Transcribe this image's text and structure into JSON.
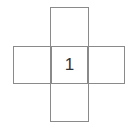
{
  "diagram": {
    "type": "cube-net-cross",
    "squares": [
      {
        "position": "top",
        "label": ""
      },
      {
        "position": "left",
        "label": ""
      },
      {
        "position": "center",
        "label": "1"
      },
      {
        "position": "right",
        "label": ""
      },
      {
        "position": "bottom",
        "label": ""
      }
    ],
    "center_label": "1",
    "line_color": "#8a8a8a",
    "text_color": "#333333"
  }
}
